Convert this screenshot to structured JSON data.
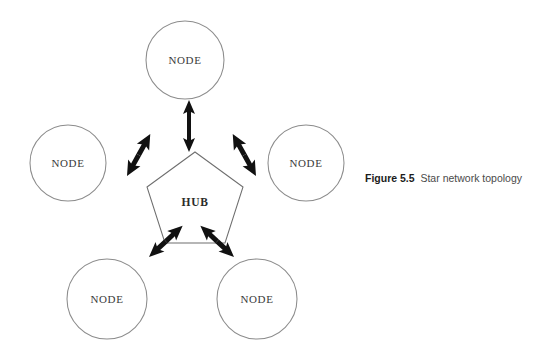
{
  "figure": {
    "caption_label": "Figure 5.5",
    "caption_text": "Star network topology",
    "background_color": "#ffffff",
    "stroke_color": "#8c8c8c",
    "arrow_color": "#111111",
    "text_color": "#3a3a3a"
  },
  "diagram": {
    "type": "star-network-topology",
    "hub": {
      "label": "HUB",
      "shape": "pentagon",
      "center_x": 195,
      "center_y": 201,
      "radius": 50
    },
    "nodes": [
      {
        "label": "NODE",
        "position": "top",
        "cx": 185,
        "cy": 60,
        "r": 39
      },
      {
        "label": "NODE",
        "position": "left",
        "cx": 68,
        "cy": 163,
        "r": 38
      },
      {
        "label": "NODE",
        "position": "right",
        "cx": 306,
        "cy": 163,
        "r": 38
      },
      {
        "label": "NODE",
        "position": "bottom-left",
        "cx": 107,
        "cy": 299,
        "r": 40
      },
      {
        "label": "NODE",
        "position": "bottom-right",
        "cx": 257,
        "cy": 299,
        "r": 40
      }
    ],
    "links": [
      {
        "from": "hub",
        "to": "top",
        "style": "double-headed-arrow"
      },
      {
        "from": "hub",
        "to": "left",
        "style": "double-headed-arrow"
      },
      {
        "from": "hub",
        "to": "right",
        "style": "double-headed-arrow"
      },
      {
        "from": "hub",
        "to": "bottom-left",
        "style": "double-headed-arrow"
      },
      {
        "from": "hub",
        "to": "bottom-right",
        "style": "double-headed-arrow"
      }
    ]
  }
}
